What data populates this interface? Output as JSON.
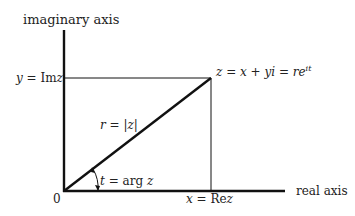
{
  "diagram": {
    "type": "complex-plane",
    "axes": {
      "imaginary_label": "imaginary axis",
      "real_label": "real axis",
      "origin_label": "0"
    },
    "labels": {
      "y_eq": "y = ",
      "im_z": "Im",
      "z_var": "z",
      "x_eq": "x = ",
      "re_z": "Re",
      "z_point_lhs": "z = x + yi = re",
      "z_point_exp": "it",
      "radius": "r = |z|",
      "angle_t": "t",
      "angle_eq": " = arg ",
      "angle_z": "z"
    },
    "colors": {
      "axis": "#111111",
      "line": "#111111",
      "text": "#222222"
    }
  }
}
